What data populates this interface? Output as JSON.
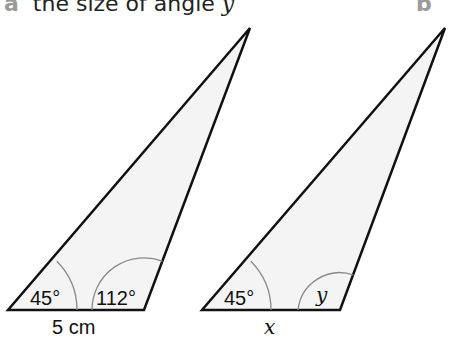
{
  "questions": [
    {
      "letter": "a",
      "text": "the size of angle ",
      "variable": "y"
    },
    {
      "letter": "b",
      "text": "",
      "variable": ""
    }
  ],
  "colors": {
    "fill": "#f4f4f4",
    "stroke": "#111111",
    "arc": "#8a8a8a"
  },
  "triangles": [
    {
      "name": "left-triangle",
      "points": [
        [
          8,
          310
        ],
        [
          144,
          310
        ],
        [
          250,
          28
        ]
      ],
      "angle_left": "45°",
      "angle_right": "112°",
      "base_label": "5 cm"
    },
    {
      "name": "right-triangle",
      "points": [
        [
          202,
          310
        ],
        [
          340,
          310
        ],
        [
          445,
          28
        ]
      ],
      "angle_left": "45°",
      "angle_right": "y",
      "base_label": "x"
    }
  ]
}
